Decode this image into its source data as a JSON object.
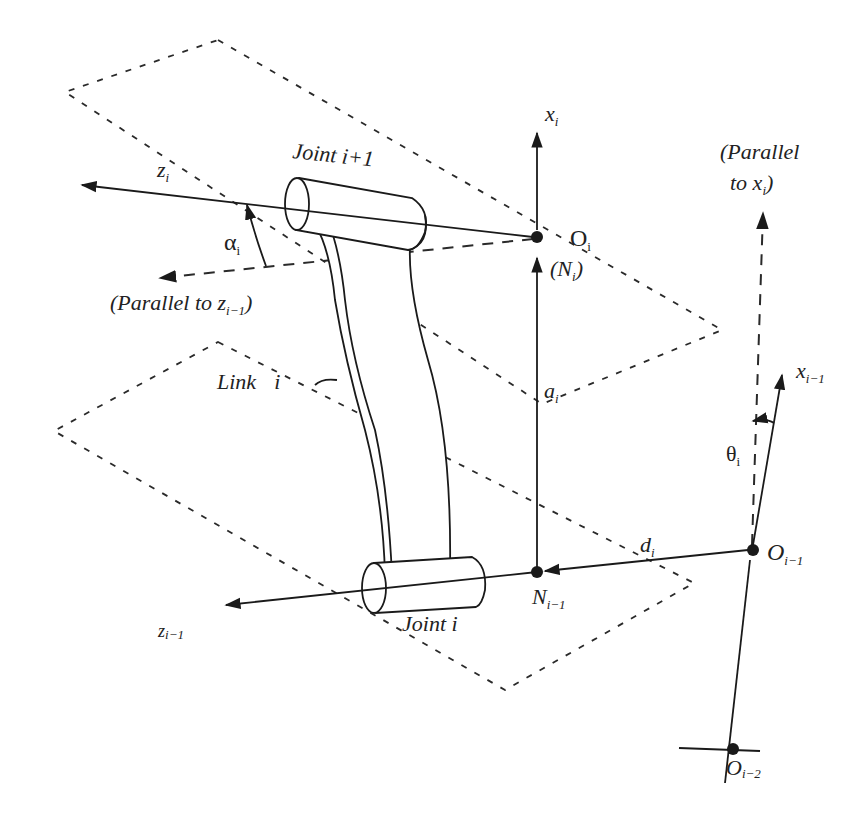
{
  "diagram": {
    "labels": {
      "z_i": {
        "main": "z",
        "sub": "i"
      },
      "x_i": {
        "main": "x",
        "sub": "i"
      },
      "joint_i_plus_1": "Joint i+1",
      "alpha_i": {
        "main": "α",
        "sub": "i"
      },
      "parallel_to_z": {
        "prefix": "(Parallel to z",
        "sub": "i−1",
        "suffix": ")"
      },
      "O_i": {
        "main": "O",
        "sub": "i"
      },
      "N_i": {
        "prefix": "(N",
        "sub": "i",
        "suffix": ")"
      },
      "parallel_to_x_line1": "(Parallel",
      "parallel_to_x_line2": {
        "prefix": "to  x",
        "sub": "i",
        "suffix": ")"
      },
      "link_i": {
        "main": "Link",
        "sub": "i"
      },
      "a_i": {
        "main": "a",
        "sub": "i"
      },
      "x_i_minus_1": {
        "main": "x",
        "sub": "i−1"
      },
      "theta_i": {
        "main": "θ",
        "sub": "i"
      },
      "d_i": {
        "main": "d",
        "sub": "i"
      },
      "O_i_minus_1": {
        "main": "O",
        "sub": "i−1"
      },
      "N_i_minus_1": {
        "main": "N",
        "sub": "i−1"
      },
      "z_i_minus_1": {
        "main": "z",
        "sub": "i−1"
      },
      "joint_i": "Joint  i",
      "O_i_minus_2": {
        "main": "O",
        "sub": "i−2"
      }
    },
    "points": {
      "O_i": [
        537,
        237
      ],
      "N_i_minus_1": [
        537,
        572
      ],
      "O_i_minus_1": [
        753,
        550
      ],
      "O_i_minus_2": [
        738,
        749
      ]
    },
    "colors": {
      "ink": "#1a1a1a",
      "background": "#ffffff"
    }
  }
}
